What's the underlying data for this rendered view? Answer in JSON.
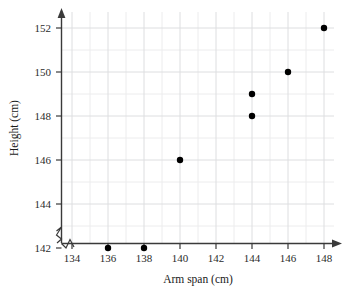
{
  "chart_data": {
    "type": "scatter",
    "title": "",
    "xlabel": "Arm span (cm)",
    "ylabel": "Height (cm)",
    "xlim": [
      133,
      149
    ],
    "ylim": [
      141,
      152.6
    ],
    "xticks": [
      134,
      136,
      138,
      140,
      142,
      144,
      146,
      148
    ],
    "yticks": [
      142,
      144,
      146,
      148,
      150,
      152
    ],
    "xtick_labels": [
      "134",
      "136",
      "138",
      "140",
      "142",
      "144",
      "146",
      "148"
    ],
    "ytick_labels": [
      "142",
      "144",
      "146",
      "148",
      "150",
      "152"
    ],
    "grid": true,
    "grid_minor_step": 1,
    "legend": "none",
    "axis_break_x": true,
    "axis_break_y": true,
    "x": [
      136,
      138,
      140,
      144,
      144,
      146,
      148
    ],
    "y": [
      142,
      142,
      146,
      148,
      149,
      150,
      152
    ],
    "points": [
      {
        "x": 136,
        "y": 142
      },
      {
        "x": 138,
        "y": 142
      },
      {
        "x": 140,
        "y": 146
      },
      {
        "x": 144,
        "y": 148
      },
      {
        "x": 144,
        "y": 149
      },
      {
        "x": 146,
        "y": 150
      },
      {
        "x": 148,
        "y": 152
      }
    ],
    "marker": "filled-circle",
    "marker_color": "#000000",
    "grid_color": "#ececed",
    "axis_color": "#3a3a3a"
  },
  "axes": {
    "x_title": "Arm span (cm)",
    "y_title": "Height (cm)"
  }
}
